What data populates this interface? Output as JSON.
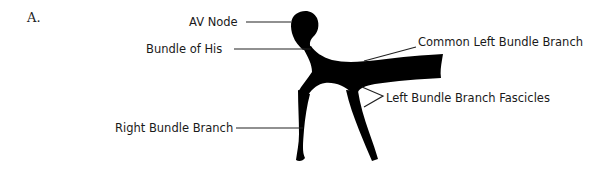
{
  "figure": {
    "panel_label": "A.",
    "labels": {
      "av_node": "AV Node",
      "bundle_of_his": "Bundle of His",
      "common_left_bundle_branch": "Common Left Bundle Branch",
      "left_bundle_branch_fascicles": "Left Bundle Branch Fascicles",
      "right_bundle_branch": "Right Bundle Branch"
    },
    "colors": {
      "structure": "#000000",
      "text": "#1a1a1a",
      "background": "#ffffff"
    }
  }
}
